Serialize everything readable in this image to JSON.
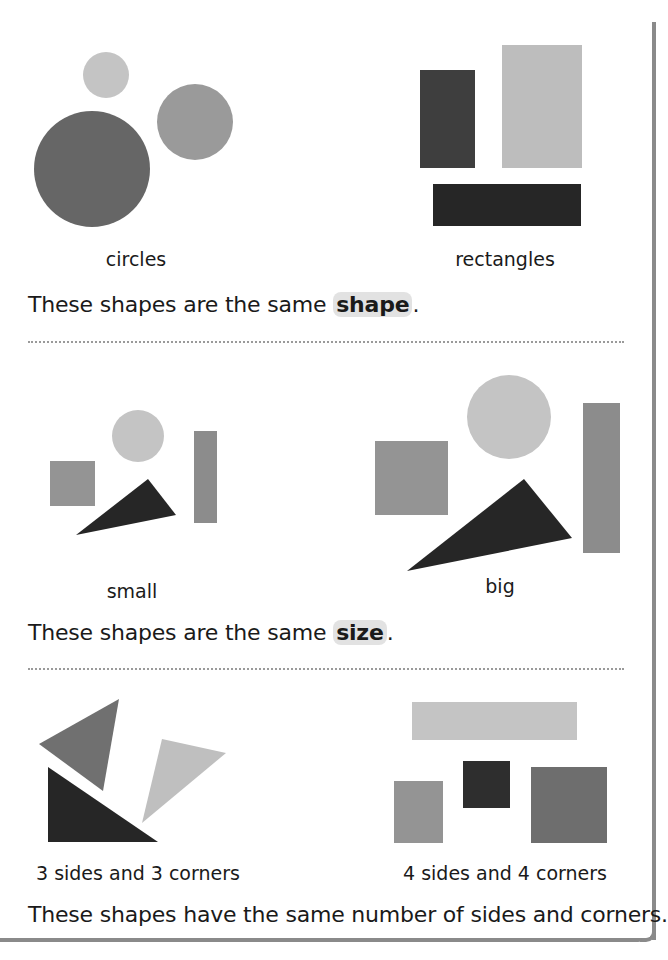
{
  "section_shape": {
    "left_label": "circles",
    "right_label": "rectangles",
    "sentence_prefix": "These shapes are the same ",
    "highlight": "shape",
    "sentence_suffix": "."
  },
  "section_size": {
    "left_label": "small",
    "right_label": "big",
    "sentence_prefix": "These shapes are the same ",
    "highlight": "size",
    "sentence_suffix": "."
  },
  "section_sides": {
    "left_label": "3 sides and 3 corners",
    "right_label": "4 sides and 4 corners",
    "sentence": "These shapes have the same number of sides and corners."
  },
  "colors": {
    "light_gray": "#bdbdbd",
    "mid_gray": "#8f8f8f",
    "dark_gray": "#6b6b6b",
    "near_black": "#2b2b2b",
    "highlight_bg": "#e2e2e2",
    "frame": "#8a8a8a"
  }
}
